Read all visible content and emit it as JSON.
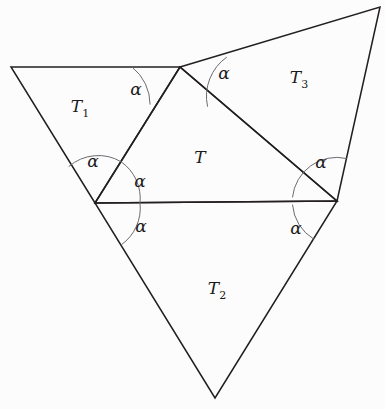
{
  "figure": {
    "background_color": "#fcfcfc",
    "stroke_color": "#231f20",
    "arc_color": "#6d6a70",
    "width": 385,
    "height": 409
  },
  "geometry": {
    "points": {
      "top": [
        180,
        67
      ],
      "left_outer": [
        11,
        67
      ],
      "bottom_left": [
        95,
        203
      ],
      "right": [
        337,
        201
      ],
      "top_right": [
        380,
        7
      ],
      "bottom": [
        215,
        398
      ]
    },
    "central_triangle": "180,67 95,203 337,201",
    "t1_triangle": "11,67 180,67 95,203",
    "t2_triangle": "95,203 337,201 215,398",
    "t3_triangle": "180,67 380,7 337,201"
  },
  "labels": {
    "regions": [
      {
        "name": "t-center",
        "text": "T",
        "sub": "",
        "x": 200,
        "y": 157
      },
      {
        "name": "t1",
        "text": "T",
        "sub": "1",
        "x": 80,
        "y": 108
      },
      {
        "name": "t2",
        "text": "T",
        "sub": "2",
        "x": 217,
        "y": 290
      },
      {
        "name": "t3",
        "text": "T",
        "sub": "3",
        "x": 299,
        "y": 79
      }
    ],
    "angles": [
      {
        "name": "alpha-top-left",
        "text": "α",
        "x": 136,
        "y": 89
      },
      {
        "name": "alpha-top-right",
        "text": "α",
        "x": 224,
        "y": 73
      },
      {
        "name": "alpha-left-upper",
        "text": "α",
        "x": 93,
        "y": 161
      },
      {
        "name": "alpha-left-middle",
        "text": "α",
        "x": 140,
        "y": 181
      },
      {
        "name": "alpha-left-lower",
        "text": "α",
        "x": 141,
        "y": 226
      },
      {
        "name": "alpha-right-upper",
        "text": "α",
        "x": 321,
        "y": 162
      },
      {
        "name": "alpha-right-lower",
        "text": "α",
        "x": 296,
        "y": 228
      }
    ]
  }
}
